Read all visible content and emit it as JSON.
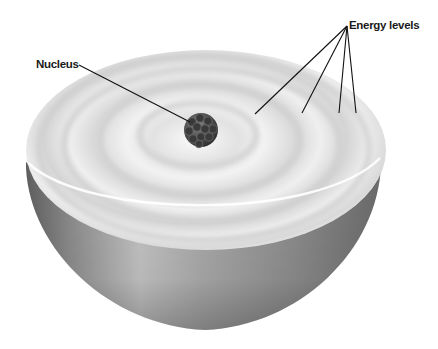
{
  "diagram": {
    "labels": {
      "nucleus": "Nucleus",
      "energy_levels": "Energy levels"
    },
    "energy_level_count": 4,
    "colors": {
      "background": "#ffffff",
      "cut_face": "#efefef",
      "ring_shade": "#d2d2d2",
      "bowl_light": "#b8b8b8",
      "bowl_dark": "#6e6e6e",
      "nucleus": "#4a4a4a",
      "leader_line": "#111111",
      "label_text": "#1a1a1a"
    }
  }
}
